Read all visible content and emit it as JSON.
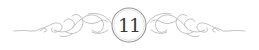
{
  "ornament": {
    "chapter_number": "11",
    "colors": {
      "flourish": "#b9b9b9",
      "circle": "#9a9a9a",
      "number": "#3a3a3a",
      "background": "#ffffff"
    }
  }
}
